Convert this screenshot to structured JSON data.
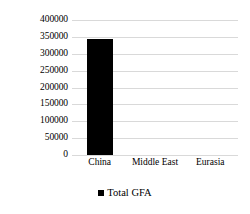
{
  "chart_data": {
    "type": "bar",
    "title": "",
    "subtitle": "",
    "xlabel": "",
    "ylabel": "",
    "categories": [
      "China",
      "Middle East",
      "Eurasia"
    ],
    "series": [
      {
        "name": "Total GFA",
        "color": "#000000",
        "values": [
          345000,
          0,
          0
        ]
      }
    ],
    "ylim": [
      0,
      400000
    ],
    "ytick_step": 50000,
    "yticks": [
      400000,
      350000,
      300000,
      250000,
      200000,
      150000,
      100000,
      50000,
      0
    ],
    "ytick_labels": [
      "400000",
      "350000",
      "300000",
      "250000",
      "200000",
      "150000",
      "100000",
      "50000",
      "0"
    ],
    "grid": true,
    "grid_axis": "y",
    "grid_color": "#d9d9d9",
    "legend": {
      "position": "bottom",
      "entries": [
        {
          "label": "Total GFA",
          "color": "#000000",
          "marker": "square"
        }
      ]
    },
    "background_color": "#ffffff"
  }
}
